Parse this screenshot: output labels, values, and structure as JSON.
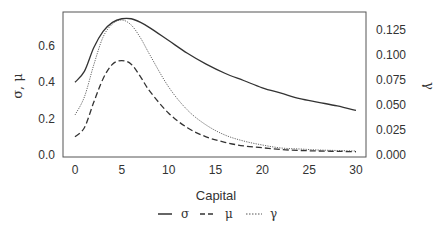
{
  "chart_data": {
    "type": "line",
    "title": "",
    "xlabel": "Capital",
    "ylabel": "σ, μ",
    "ylabel_right": "γ",
    "xlim": [
      -1.5,
      31.5
    ],
    "ylim": [
      0.0,
      0.78
    ],
    "ylim_right": [
      0.0,
      0.14
    ],
    "x_ticks": [
      "0",
      "5",
      "10",
      "15",
      "20",
      "25",
      "30"
    ],
    "y_ticks": [
      "0.0",
      "0.2",
      "0.4",
      "0.6"
    ],
    "y_ticks_right": [
      "0.000",
      "0.025",
      "0.050",
      "0.075",
      "0.100",
      "0.125"
    ],
    "grid": false,
    "legend_position": "bottom-center",
    "x": [
      0,
      1,
      2,
      3,
      4,
      5,
      6,
      7,
      8,
      10,
      12,
      14,
      16,
      18,
      20,
      22,
      24,
      26,
      28,
      30
    ],
    "series": [
      {
        "name": "σ",
        "axis": "left",
        "style": "solid",
        "values": [
          0.4,
          0.46,
          0.59,
          0.68,
          0.73,
          0.75,
          0.75,
          0.73,
          0.7,
          0.63,
          0.56,
          0.5,
          0.45,
          0.41,
          0.37,
          0.34,
          0.31,
          0.29,
          0.27,
          0.245
        ]
      },
      {
        "name": "μ",
        "axis": "left",
        "style": "dashed",
        "values": [
          0.1,
          0.15,
          0.29,
          0.42,
          0.5,
          0.52,
          0.5,
          0.43,
          0.35,
          0.23,
          0.15,
          0.1,
          0.07,
          0.05,
          0.04,
          0.03,
          0.025,
          0.022,
          0.02,
          0.018
        ]
      },
      {
        "name": "γ",
        "axis": "right",
        "style": "dotted",
        "values": [
          0.04,
          0.058,
          0.09,
          0.118,
          0.131,
          0.135,
          0.13,
          0.117,
          0.1,
          0.068,
          0.045,
          0.03,
          0.02,
          0.014,
          0.01,
          0.007,
          0.006,
          0.005,
          0.0045,
          0.004
        ]
      }
    ]
  },
  "legend": {
    "items": [
      {
        "label": "σ",
        "style": "solid"
      },
      {
        "label": "μ",
        "style": "dashed"
      },
      {
        "label": "γ",
        "style": "dotted"
      }
    ]
  }
}
